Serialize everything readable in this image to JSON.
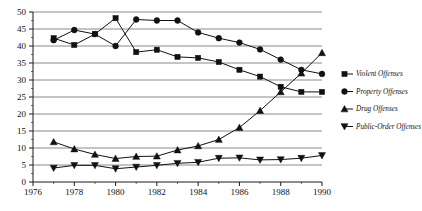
{
  "chart_data": {
    "type": "line",
    "title": "",
    "xlabel": "",
    "ylabel": "",
    "xlim": [
      1976,
      1990
    ],
    "ylim": [
      0,
      50
    ],
    "grid": true,
    "grid_axis": "y",
    "legend_position": "right",
    "x": [
      1977,
      1978,
      1979,
      1980,
      1981,
      1982,
      1983,
      1984,
      1985,
      1986,
      1987,
      1988,
      1989,
      1990
    ],
    "xticks": [
      1976,
      1978,
      1980,
      1982,
      1984,
      1986,
      1988,
      1990
    ],
    "xticklabels": [
      "1976",
      "1978",
      "1980",
      "1982",
      "1984",
      "1986",
      "1988",
      "1990"
    ],
    "xminorticks": [
      1977,
      1979,
      1981,
      1983,
      1985,
      1987,
      1989
    ],
    "yticks": [
      0,
      5,
      10,
      15,
      20,
      25,
      30,
      35,
      40,
      45,
      50
    ],
    "yticklabels": [
      "0",
      "5",
      "10",
      "15",
      "20",
      "25",
      "30",
      "35",
      "40",
      "45",
      "50"
    ],
    "yminorticks": [
      2.5,
      7.5,
      12.5,
      17.5,
      22.5,
      27.5,
      32.5,
      37.5,
      42.5,
      47.5
    ],
    "series": [
      {
        "name": "Violent Offenses",
        "marker": "square",
        "values": [
          42.3,
          40.3,
          43.5,
          48.2,
          38.2,
          38.9,
          36.8,
          36.5,
          35.3,
          33.0,
          31.0,
          28.0,
          26.5,
          26.5
        ]
      },
      {
        "name": "Property Offenses",
        "marker": "circle",
        "values": [
          41.7,
          44.7,
          43.5,
          40.0,
          47.8,
          47.5,
          47.5,
          44.0,
          42.3,
          41.0,
          39.0,
          36.0,
          33.0,
          31.8
        ]
      },
      {
        "name": "Drug Offenses",
        "marker": "triangle-up",
        "values": [
          11.8,
          9.7,
          8.1,
          6.9,
          7.5,
          7.6,
          9.4,
          10.6,
          12.5,
          16.0,
          21.0,
          26.5,
          32.0,
          38.0
        ]
      },
      {
        "name": "Public-Order Offenses",
        "marker": "triangle-down",
        "values": [
          4.1,
          4.9,
          4.9,
          3.9,
          4.4,
          4.9,
          5.5,
          5.8,
          7.0,
          7.1,
          6.5,
          6.6,
          7.0,
          7.8
        ]
      }
    ]
  },
  "legend": {
    "entries": [
      {
        "label": "Violent Offenses",
        "marker": "square"
      },
      {
        "label": "Property Offenses",
        "marker": "circle"
      },
      {
        "label": "Drug Offenses",
        "marker": "triangle-up"
      },
      {
        "label": "Public-Order Offenses",
        "marker": "triangle-down"
      }
    ]
  },
  "colors": {
    "ink": "#111111",
    "grid": "#8a8a8a",
    "background": "#ffffff"
  }
}
